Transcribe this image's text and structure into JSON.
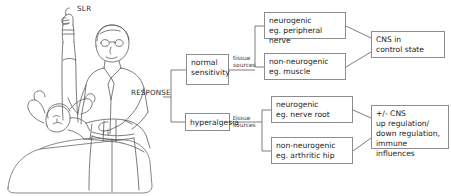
{
  "figure": {
    "title_label": "SLR",
    "response_label": "RESPONSE",
    "illustration_name": "clinician-performing-straight-leg-raise-on-supine-patient"
  },
  "connector_labels": {
    "tissue_sources_upper": "tissue\nsources",
    "tissue_sources_lower": "tissue\nsources"
  },
  "flowchart": {
    "type": "tree-diagram",
    "root": "RESPONSE",
    "branches": [
      {
        "id": "normal-sensitivity",
        "label": "normal\nsensitivity",
        "connector": "tissue\nsources",
        "children": [
          {
            "id": "neurogenic-peripheral-nerve",
            "label": "neurogenic\neg. peripheral nerve",
            "outcome": "cns-in-control-state"
          },
          {
            "id": "non-neurogenic-muscle",
            "label": "non-neurogenic\neg. muscle",
            "outcome": "cns-in-control-state"
          }
        ]
      },
      {
        "id": "hyperalgesia",
        "label": "hyperalgesia",
        "connector": "tissue\nsources",
        "children": [
          {
            "id": "neurogenic-nerve-root",
            "label": "neurogenic\neg. nerve root",
            "outcome": "cns-modulation"
          },
          {
            "id": "non-neurogenic-arthritic-hip",
            "label": "non-neurogenic\neg. arthritic hip",
            "outcome": "cns-modulation"
          }
        ]
      }
    ],
    "outcomes": [
      {
        "id": "cns-in-control-state",
        "label": "CNS in\ncontrol state"
      },
      {
        "id": "cns-modulation",
        "label": "+/- CNS\nup regulation/\ndown regulation,\nimmune influences"
      }
    ]
  },
  "nodes": {
    "normal_sensitivity": "normal\nsensitivity",
    "hyperalgesia": "hyperalgesia",
    "neurogenic_peripheral_nerve": "neurogenic\neg. peripheral nerve",
    "non_neurogenic_muscle": "non-neurogenic\neg. muscle",
    "neurogenic_nerve_root": "neurogenic\neg. nerve root",
    "non_neurogenic_arthritic_hip": "non-neurogenic\neg. arthritic hip",
    "cns_in_control_state": "CNS in\ncontrol state",
    "cns_modulation": "+/- CNS\nup regulation/\ndown regulation,\nimmune influences"
  },
  "colors": {
    "background": "#ffffff",
    "box_border": "#8d8d8d",
    "text": "#232323",
    "line_art": "#5a5a5a",
    "connector": "#6f6f6f"
  }
}
